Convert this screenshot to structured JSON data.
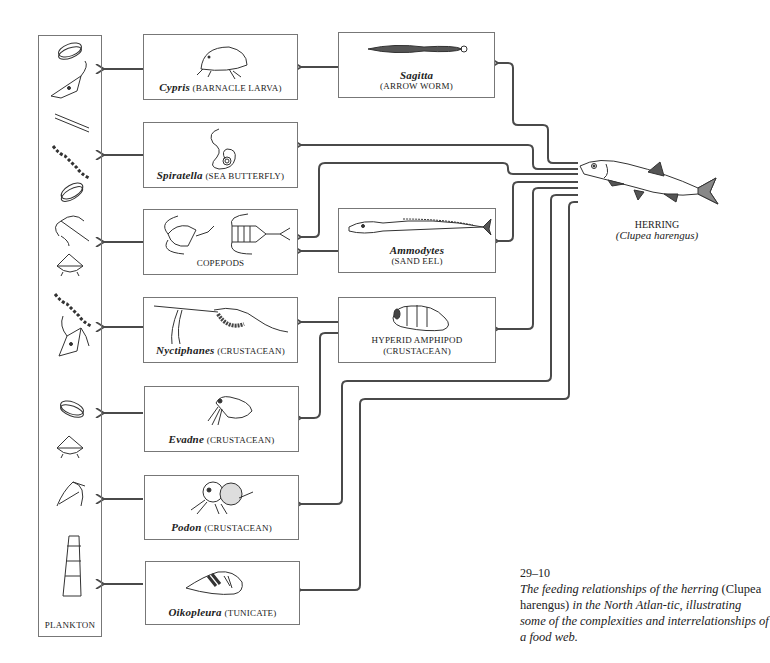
{
  "diagram": {
    "title_number": "29–10",
    "caption": {
      "part1": "The feeding relationships of the herring",
      "species": "(Clupea harengus)",
      "part2": "in the North Atlan-tic, illustrating some of the complexities and interrelationships of a food web."
    },
    "top_predator": {
      "common": "HERRING",
      "scientific": "(Clupea harengus)"
    },
    "plankton_column": {
      "label": "PLANKTON",
      "organism_icons": [
        "diatom-disc",
        "dinoflagellate",
        "chain-diatom",
        "chain-colony",
        "diatom-disc",
        "ceratium",
        "radiolarian-cone",
        "chain-colony",
        "dinoflagellate",
        "diatom-disc",
        "radiolarian-cone",
        "ceratium",
        "diatom-chain-segment"
      ]
    },
    "middle_column": [
      {
        "sci": "Cypris",
        "common": "(BARNACLE LARVA)"
      },
      {
        "sci": "Spiratella",
        "common": "(SEA BUTTERFLY)"
      },
      {
        "sci": "",
        "common": "COPEPODS"
      },
      {
        "sci": "Nyctiphanes",
        "common": "(CRUSTACEAN)"
      },
      {
        "sci": "Evadne",
        "common": "(CRUSTACEAN)"
      },
      {
        "sci": "Podon",
        "common": "(CRUSTACEAN)"
      },
      {
        "sci": "Oikopleura",
        "common": "(TUNICATE)"
      }
    ],
    "right_column": [
      {
        "sci": "Sagitta",
        "common": "(ARROW WORM)"
      },
      {
        "sci": "Ammodytes",
        "common": "(SAND EEL)"
      },
      {
        "sci": "",
        "common": "HYPERID AMPHIPOD",
        "common2": "(CRUSTACEAN)"
      }
    ],
    "edges": [
      {
        "from": "Herring",
        "to": "Sagitta"
      },
      {
        "from": "Herring",
        "to": "Spiratella"
      },
      {
        "from": "Herring",
        "to": "Copepods"
      },
      {
        "from": "Herring",
        "to": "Ammodytes"
      },
      {
        "from": "Herring",
        "to": "Hyperid Amphipod"
      },
      {
        "from": "Herring",
        "to": "Evadne"
      },
      {
        "from": "Herring",
        "to": "Podon"
      },
      {
        "from": "Herring",
        "to": "Oikopleura"
      },
      {
        "from": "Sagitta",
        "to": "Cypris"
      },
      {
        "from": "Ammodytes",
        "to": "Copepods"
      },
      {
        "from": "Hyperid Amphipod",
        "to": "Nyctiphanes"
      },
      {
        "from": "Hyperid Amphipod",
        "to": "Evadne"
      },
      {
        "from": "Cypris",
        "to": "Plankton"
      },
      {
        "from": "Spiratella",
        "to": "Plankton"
      },
      {
        "from": "Copepods",
        "to": "Plankton"
      },
      {
        "from": "Nyctiphanes",
        "to": "Plankton"
      },
      {
        "from": "Evadne",
        "to": "Plankton"
      },
      {
        "from": "Podon",
        "to": "Plankton"
      },
      {
        "from": "Oikopleura",
        "to": "Plankton"
      }
    ],
    "colors": {
      "line": "#4a4a4a",
      "box_border": "#777777",
      "background": "#ffffff"
    }
  }
}
